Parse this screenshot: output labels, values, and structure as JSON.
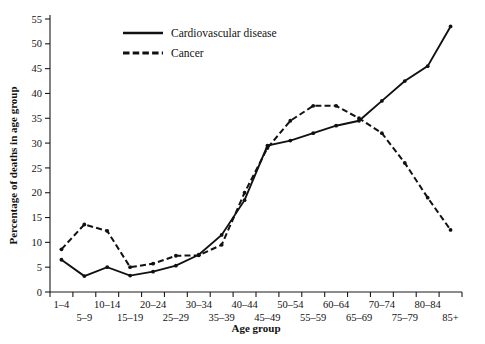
{
  "chart_data": {
    "type": "line",
    "title": "",
    "xlabel": "Age group",
    "ylabel": "Percentage of deaths in age group",
    "categories": [
      "1–4",
      "5–9",
      "10–14",
      "15–19",
      "20–24",
      "25–29",
      "30–34",
      "35–39",
      "40–44",
      "45–49",
      "50–54",
      "55–59",
      "60–64",
      "65–69",
      "70–74",
      "75–79",
      "80–84",
      "85+"
    ],
    "ylim": [
      0,
      55
    ],
    "yticks": [
      0,
      5,
      10,
      15,
      20,
      25,
      30,
      35,
      40,
      45,
      50,
      55
    ],
    "ytick_labels": [
      "0",
      "5",
      "10",
      "15",
      "20",
      "25",
      "30",
      "35",
      "40",
      "45",
      "50",
      "55"
    ],
    "grid": false,
    "legend_position": "upper-left",
    "series": [
      {
        "name": "Cardiovascular disease",
        "style": "solid",
        "values": [
          6.5,
          3.2,
          5.0,
          3.3,
          4.1,
          5.3,
          7.5,
          11.5,
          18.5,
          29.5,
          30.5,
          32.0,
          33.5,
          34.5,
          38.5,
          42.5,
          45.5,
          53.5
        ]
      },
      {
        "name": "Cancer",
        "style": "dashed",
        "values": [
          8.6,
          13.6,
          12.3,
          5.0,
          5.7,
          7.3,
          7.4,
          9.5,
          20.0,
          29.0,
          34.5,
          37.5,
          37.5,
          35.0,
          32.0,
          26.0,
          19.0,
          12.5
        ]
      }
    ]
  },
  "legend": {
    "entries": [
      {
        "label": "Cardiovascular disease",
        "style": "solid"
      },
      {
        "label": "Cancer",
        "style": "dashed"
      }
    ]
  }
}
